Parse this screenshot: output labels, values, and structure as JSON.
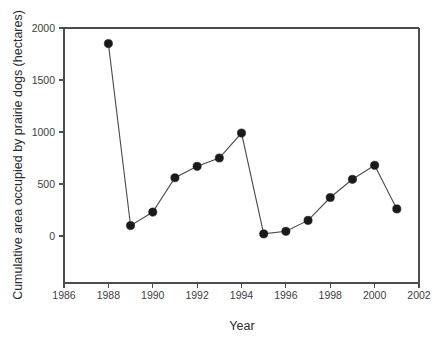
{
  "chart_data": {
    "type": "line",
    "title": "",
    "subtitle": "",
    "xlabel": "Year",
    "ylabel": "Cumulative area occupied by prairie dogs (hectares)",
    "x": [
      1988,
      1989,
      1990,
      1991,
      1992,
      1993,
      1994,
      1995,
      1996,
      1997,
      1998,
      1999,
      2000,
      2001
    ],
    "values": [
      1850,
      100,
      230,
      560,
      670,
      750,
      990,
      20,
      45,
      150,
      370,
      545,
      680,
      260
    ],
    "series": [
      {
        "name": "Cumulative area occupied by prairie dogs",
        "x": [
          1988,
          1989,
          1990,
          1991,
          1992,
          1993,
          1994,
          1995,
          1996,
          1997,
          1998,
          1999,
          2000,
          2001
        ],
        "values": [
          1850,
          100,
          230,
          560,
          670,
          750,
          990,
          20,
          45,
          150,
          370,
          545,
          680,
          260
        ],
        "marker": "filled-circle",
        "color": "#1a1a1a"
      }
    ],
    "xlim": [
      1986,
      2002
    ],
    "ylim": [
      0,
      2000
    ],
    "y_axis_min_drawn": -320,
    "xticks": [
      1986,
      1988,
      1990,
      1992,
      1994,
      1996,
      1998,
      2000,
      2002
    ],
    "xticklabels": [
      "1986",
      "1988",
      "1990",
      "1992",
      "1994",
      "1996",
      "1998",
      "2000",
      "2002"
    ],
    "yticks": [
      0,
      500,
      1000,
      1500,
      2000
    ],
    "yticklabels": [
      "0",
      "500",
      "1000",
      "1500",
      "2000"
    ],
    "grid": false,
    "legend": null,
    "legend_position": "none",
    "annotations": [],
    "colors": {
      "marker": "#1a1a1a",
      "line": "#4a4a4a",
      "axis": "#4d4d4d",
      "text": "#2b2b2b",
      "background": "#ffffff"
    }
  }
}
